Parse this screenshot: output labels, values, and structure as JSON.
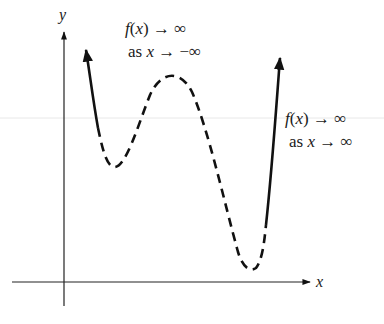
{
  "diagram": {
    "axes": {
      "x_label": "x",
      "y_label": "y"
    },
    "annotations": [
      {
        "line1": "f(x) → ∞",
        "line2": "as x → −∞",
        "position": "top-center"
      },
      {
        "line1": "f(x) → ∞",
        "line2": "as x → ∞",
        "position": "right"
      }
    ],
    "curve": {
      "left_end": "rises to infinity (solid arrow)",
      "local_min_1": "left trough",
      "local_max": "middle peak",
      "local_min_2": "right trough near x-axis",
      "right_end": "rises to infinity (solid arrow)",
      "middle_style": "dashed"
    },
    "colors": {
      "stroke": "#111111",
      "background": "#ffffff"
    }
  }
}
